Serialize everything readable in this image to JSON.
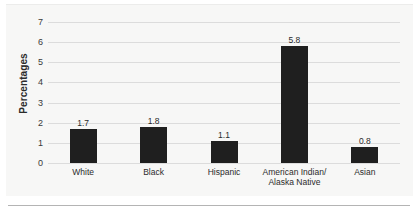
{
  "figure": {
    "y_axis_title": "Percentages",
    "background_color": "#f7f7f6",
    "bar_color": "#1f1f1f",
    "gridline_color": "#dcdcdc",
    "rule_color": "#b4b4b4"
  },
  "chart_data": {
    "type": "bar",
    "title": "",
    "xlabel": "",
    "ylabel": "Percentages",
    "categories": [
      "White",
      "Black",
      "Hispanic",
      "American Indian/\nAlaska Native",
      "Asian"
    ],
    "values": [
      1.7,
      1.8,
      1.1,
      5.8,
      0.8
    ],
    "value_labels": [
      "1.7",
      "1.8",
      "1.1",
      "5.8",
      "0.8"
    ],
    "ylim": [
      0,
      7
    ],
    "yticks": [
      0,
      1,
      2,
      3,
      4,
      5,
      6,
      7
    ],
    "ytick_labels": [
      "0",
      "1",
      "2",
      "3",
      "4",
      "5",
      "6",
      "7"
    ],
    "grid": true,
    "legend": null,
    "legend_position": "none"
  }
}
